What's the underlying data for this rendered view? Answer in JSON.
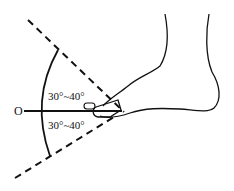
{
  "diagram": {
    "type": "foot-angle-diagram",
    "reference_label": "O",
    "upper_angle_label": "30°~40°",
    "lower_angle_label": "30°~40°",
    "colors": {
      "line": "#111111",
      "background": "#ffffff"
    }
  }
}
